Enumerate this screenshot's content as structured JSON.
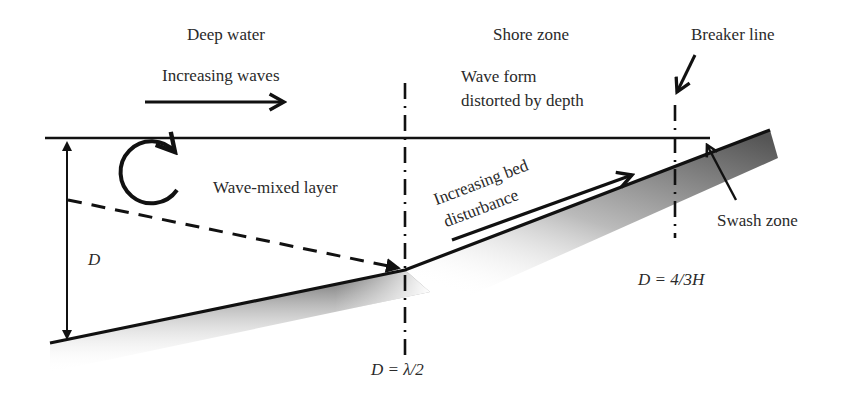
{
  "diagram": {
    "labels": {
      "deep_water": "Deep water",
      "increasing_waves": "Increasing waves",
      "shore_zone": "Shore zone",
      "wave_form_line1": "Wave form",
      "wave_form_line2": "distorted by depth",
      "breaker_line": "Breaker line",
      "wave_mixed_layer": "Wave-mixed layer",
      "increasing_bed_line1": "Increasing bed",
      "increasing_bed_line2": "disturbance",
      "swash_zone": "Swash zone",
      "depth_symbol": "D",
      "deep_boundary_eq": "D = λ/2",
      "breaker_eq": "D = 4/3H"
    },
    "colors": {
      "line": "#111111",
      "text": "#2a2a2a",
      "bed_shade_dark": "#555555",
      "bed_shade_light": "#ffffff"
    }
  }
}
